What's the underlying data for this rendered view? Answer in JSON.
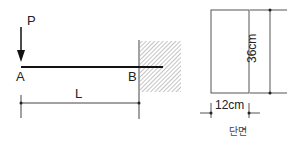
{
  "beam": {
    "load_label": "P",
    "point_a": "A",
    "point_b": "B",
    "length_label": "L"
  },
  "section": {
    "height_label": "36cm",
    "width_label": "12cm",
    "caption": "단면"
  },
  "colors": {
    "line": "#222222",
    "hatch": "#8a8a8a"
  }
}
